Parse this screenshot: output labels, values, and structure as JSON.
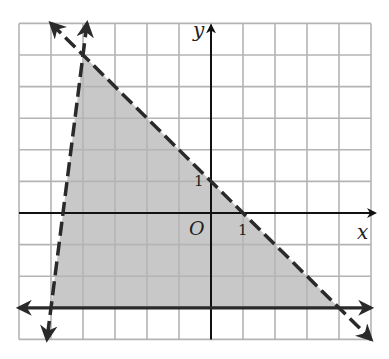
{
  "chart_data": {
    "type": "line",
    "title": "",
    "subtitle": "System of linear inequalities (shaded feasible region)",
    "xlabel": "x",
    "ylabel": "y",
    "origin_label": "O",
    "tick_labels": {
      "x": [
        "1"
      ],
      "y": [
        "1"
      ]
    },
    "xlim": [
      -6,
      5
    ],
    "ylim": [
      -4,
      6
    ],
    "grid": true,
    "legend": null,
    "series": [
      {
        "name": "boundary-1",
        "style": "dashed",
        "equation": "y = -x + 1",
        "points": [
          [
            -5,
            6
          ],
          [
            5,
            -4
          ]
        ]
      },
      {
        "name": "boundary-2",
        "style": "dashed",
        "equation": "y = 8x + 37",
        "points": [
          [
            -3.875,
            6
          ],
          [
            -5.125,
            -4
          ]
        ]
      },
      {
        "name": "boundary-3",
        "style": "solid",
        "equation": "y = -3",
        "points": [
          [
            -6,
            -3
          ],
          [
            5,
            -3
          ]
        ]
      }
    ],
    "shaded_region": {
      "vertices": [
        [
          -4,
          5
        ],
        [
          -5,
          -3
        ],
        [
          4,
          -3
        ]
      ],
      "color": "#c8c8c8"
    }
  },
  "colors": {
    "grid": "#b4b4b4",
    "axis": "#111111",
    "boundary": "#2a2a2a",
    "shade": "#c8c8c8"
  }
}
